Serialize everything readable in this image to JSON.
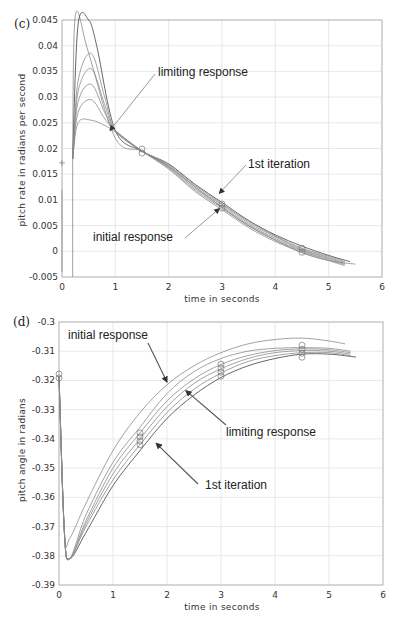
{
  "chart_data": [
    {
      "type": "line",
      "panel_label": "(c)",
      "title": "",
      "xlabel": "time in seconds",
      "ylabel": "pitch rate in radians per second",
      "xlim": [
        0,
        6
      ],
      "ylim": [
        -0.005,
        0.045
      ],
      "xticks": [
        "0",
        "1",
        "2",
        "3",
        "4",
        "5",
        "6"
      ],
      "yticks": [
        "-0.005",
        "0",
        "0.005",
        "0.01",
        "0.015",
        "0.02",
        "0.025",
        "0.03",
        "0.035",
        "0.04",
        "0.045"
      ],
      "grid": true,
      "annotations": [
        {
          "text": "limiting response",
          "target": [
            0.9,
            0.0235
          ]
        },
        {
          "text": "1st iteration",
          "target": [
            2.95,
            0.0113
          ]
        },
        {
          "text": "initial response",
          "target": [
            2.95,
            0.0083
          ]
        }
      ],
      "markers": [
        {
          "x": 0.0,
          "y": 0.0172,
          "shape": "plus"
        },
        {
          "x": 1.5,
          "y": 0.0195,
          "shape": "circle"
        },
        {
          "x": 3.0,
          "y": 0.0088,
          "shape": "circle"
        },
        {
          "x": 4.5,
          "y": 0.0002,
          "shape": "circle"
        }
      ],
      "series": [
        {
          "name": "initial response",
          "x": [
            0.2,
            0.25,
            0.5,
            1.0,
            1.5,
            2.0,
            2.5,
            3.0,
            3.5,
            4.0,
            4.5,
            5.0,
            5.5
          ],
          "y": [
            0.018,
            0.0458,
            0.0385,
            0.022,
            0.0195,
            0.0165,
            0.0125,
            0.0085,
            0.005,
            0.0022,
            -0.0003,
            -0.0018,
            -0.0025
          ]
        },
        {
          "name": "1st iteration",
          "x": [
            0.2,
            0.3,
            0.5,
            0.65,
            1.0,
            1.5,
            2.0,
            2.5,
            3.0,
            3.5,
            4.0,
            4.5,
            5.0,
            5.4
          ],
          "y": [
            0.018,
            0.044,
            0.045,
            0.04,
            0.0235,
            0.0195,
            0.017,
            0.013,
            0.0095,
            0.006,
            0.0032,
            0.001,
            -0.0008,
            -0.002
          ]
        },
        {
          "name": "iteration 2",
          "x": [
            0.2,
            0.3,
            0.55,
            0.8,
            1.0,
            1.5,
            2.0,
            2.5,
            3.0,
            3.5,
            4.0,
            4.5,
            5.0,
            5.3
          ],
          "y": [
            0.018,
            0.033,
            0.0385,
            0.03,
            0.0235,
            0.0195,
            0.0168,
            0.0128,
            0.0092,
            0.0058,
            0.003,
            0.0006,
            -0.001,
            -0.002
          ]
        },
        {
          "name": "iteration 3",
          "x": [
            0.2,
            0.3,
            0.55,
            0.8,
            1.0,
            1.5,
            2.0,
            2.5,
            3.0,
            3.5,
            4.0,
            4.5,
            5.0,
            5.3
          ],
          "y": [
            0.018,
            0.031,
            0.0355,
            0.0285,
            0.0235,
            0.0195,
            0.0166,
            0.0125,
            0.009,
            0.0055,
            0.0028,
            0.0004,
            -0.0012,
            -0.0022
          ]
        },
        {
          "name": "iteration 4",
          "x": [
            0.2,
            0.3,
            0.55,
            0.8,
            1.0,
            1.5,
            2.0,
            2.5,
            3.0,
            3.5,
            4.0,
            4.5,
            5.0,
            5.3
          ],
          "y": [
            0.018,
            0.029,
            0.0325,
            0.027,
            0.0235,
            0.0195,
            0.0164,
            0.0122,
            0.0087,
            0.0052,
            0.0025,
            0.0002,
            -0.0014,
            -0.0024
          ]
        },
        {
          "name": "iteration 5",
          "x": [
            0.2,
            0.3,
            0.55,
            0.8,
            1.0,
            1.5,
            2.0,
            2.5,
            3.0,
            3.5,
            4.0,
            4.5,
            5.0,
            5.3
          ],
          "y": [
            0.018,
            0.027,
            0.0295,
            0.0258,
            0.0235,
            0.0195,
            0.0162,
            0.0119,
            0.0084,
            0.0049,
            0.0022,
            0.0,
            -0.0016,
            -0.0026
          ]
        },
        {
          "name": "limiting response",
          "x": [
            0.2,
            0.3,
            0.55,
            0.8,
            1.0,
            1.5,
            2.0,
            2.5,
            3.0,
            3.5,
            4.0,
            4.5,
            5.0,
            5.3
          ],
          "y": [
            0.018,
            0.025,
            0.0255,
            0.0245,
            0.0232,
            0.0195,
            0.016,
            0.0116,
            0.0081,
            0.0046,
            0.0019,
            -0.0002,
            -0.0018,
            -0.0028
          ]
        }
      ]
    },
    {
      "type": "line",
      "panel_label": "(d)",
      "title": "",
      "xlabel": "time in seconds",
      "ylabel": "pitch angle in radians",
      "xlim": [
        0,
        6
      ],
      "ylim": [
        -0.39,
        -0.3
      ],
      "xticks": [
        "0",
        "1",
        "2",
        "3",
        "4",
        "5",
        "6"
      ],
      "yticks": [
        "-0.3",
        "-0.31",
        "-0.32",
        "-0.33",
        "-0.34",
        "-0.35",
        "-0.36",
        "-0.37",
        "-0.38",
        "-0.39"
      ],
      "grid": true,
      "annotations": [
        {
          "text": "initial response",
          "target": [
            2.0,
            -0.3205
          ]
        },
        {
          "text": "limiting response",
          "target": [
            2.35,
            -0.3235
          ]
        },
        {
          "text": "1st iteration",
          "target": [
            1.8,
            -0.3415
          ]
        }
      ],
      "markers": [
        {
          "x": 0.0,
          "y": -0.3185,
          "shape": "circle"
        },
        {
          "x": 1.5,
          "y": -0.34,
          "shape": "circle"
        },
        {
          "x": 3.0,
          "y": -0.3165,
          "shape": "circle"
        },
        {
          "x": 4.5,
          "y": -0.31,
          "shape": "circle"
        }
      ],
      "series": [
        {
          "name": "initial response",
          "x": [
            0.0,
            0.1,
            0.2,
            0.5,
            1.0,
            1.5,
            2.0,
            2.5,
            3.0,
            3.5,
            4.0,
            4.5,
            5.0,
            5.3
          ],
          "y": [
            -0.3185,
            -0.372,
            -0.374,
            -0.362,
            -0.344,
            -0.331,
            -0.3215,
            -0.315,
            -0.3105,
            -0.3075,
            -0.306,
            -0.3055,
            -0.3065,
            -0.3075
          ]
        },
        {
          "name": "1st iteration",
          "x": [
            0.0,
            0.1,
            0.2,
            0.5,
            1.0,
            1.5,
            2.0,
            2.5,
            3.0,
            3.5,
            4.0,
            4.5,
            5.0,
            5.5
          ],
          "y": [
            -0.3185,
            -0.372,
            -0.381,
            -0.372,
            -0.356,
            -0.344,
            -0.333,
            -0.325,
            -0.319,
            -0.315,
            -0.3125,
            -0.311,
            -0.311,
            -0.312
          ]
        },
        {
          "name": "iteration 2",
          "x": [
            0.0,
            0.1,
            0.2,
            0.5,
            1.0,
            1.5,
            2.0,
            2.5,
            3.0,
            3.5,
            4.0,
            4.5,
            5.0,
            5.4
          ],
          "y": [
            -0.3185,
            -0.372,
            -0.381,
            -0.37,
            -0.354,
            -0.342,
            -0.331,
            -0.323,
            -0.3175,
            -0.3135,
            -0.3115,
            -0.3105,
            -0.3105,
            -0.3115
          ]
        },
        {
          "name": "iteration 3",
          "x": [
            0.0,
            0.1,
            0.2,
            0.5,
            1.0,
            1.5,
            2.0,
            2.5,
            3.0,
            3.5,
            4.0,
            4.5,
            5.0,
            5.4
          ],
          "y": [
            -0.3185,
            -0.372,
            -0.381,
            -0.369,
            -0.352,
            -0.34,
            -0.329,
            -0.321,
            -0.316,
            -0.3125,
            -0.3105,
            -0.3098,
            -0.31,
            -0.311
          ]
        },
        {
          "name": "iteration 4",
          "x": [
            0.0,
            0.1,
            0.2,
            0.5,
            1.0,
            1.5,
            2.0,
            2.5,
            3.0,
            3.5,
            4.0,
            4.5,
            5.0,
            5.4
          ],
          "y": [
            -0.3185,
            -0.372,
            -0.381,
            -0.368,
            -0.35,
            -0.338,
            -0.327,
            -0.3195,
            -0.3145,
            -0.3115,
            -0.3098,
            -0.3092,
            -0.3095,
            -0.3105
          ]
        },
        {
          "name": "limiting response",
          "x": [
            0.0,
            0.1,
            0.2,
            0.5,
            1.0,
            1.5,
            2.0,
            2.5,
            3.0,
            3.5,
            4.0,
            4.5,
            5.0,
            5.4
          ],
          "y": [
            -0.3185,
            -0.372,
            -0.381,
            -0.366,
            -0.348,
            -0.336,
            -0.3245,
            -0.317,
            -0.3125,
            -0.31,
            -0.309,
            -0.3088,
            -0.309,
            -0.31
          ]
        }
      ]
    }
  ]
}
